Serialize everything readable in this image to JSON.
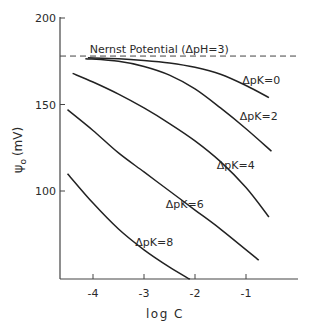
{
  "chart_data": {
    "type": "line",
    "title": "",
    "xlabel": "log C",
    "ylabel": "ψo (mV)",
    "xlim": [
      -4.65,
      0.5
    ],
    "ylim": [
      49,
      205
    ],
    "x_ticks": [
      -4,
      -3,
      -2,
      -1
    ],
    "x_tick_labels": [
      "-4",
      "-3",
      "-2",
      "-1"
    ],
    "y_ticks": [
      100,
      150,
      200
    ],
    "y_tick_labels": [
      "100",
      "150",
      "200"
    ],
    "grid": false,
    "legend": "inline labels on curves",
    "reference_line": {
      "label": "Nernst Potential (ΔpH=3)",
      "y": 178,
      "style": "dashed"
    },
    "series": [
      {
        "name": "ΔpK=0",
        "x": [
          -4.1,
          -3.5,
          -3.0,
          -2.5,
          -2.0,
          -1.5,
          -1.0,
          -0.55
        ],
        "y": [
          177,
          176.5,
          175.5,
          174,
          171.5,
          167.5,
          161,
          154
        ]
      },
      {
        "name": "ΔpK=2",
        "x": [
          -4.15,
          -3.5,
          -3.0,
          -2.5,
          -2.0,
          -1.5,
          -1.0,
          -0.5
        ],
        "y": [
          176.5,
          175,
          172,
          167,
          159,
          148,
          136,
          123
        ]
      },
      {
        "name": "ΔpK=4",
        "x": [
          -4.4,
          -4.0,
          -3.5,
          -3.0,
          -2.5,
          -2.0,
          -1.5,
          -1.0,
          -0.55
        ],
        "y": [
          168,
          163,
          156,
          148,
          139,
          129,
          117,
          102,
          85
        ]
      },
      {
        "name": "ΔpK=6",
        "x": [
          -4.5,
          -4.0,
          -3.5,
          -3.0,
          -2.5,
          -2.0,
          -1.5,
          -0.75
        ],
        "y": [
          147,
          135,
          122,
          111,
          100,
          89,
          78,
          60
        ]
      },
      {
        "name": "ΔpK=8",
        "x": [
          -4.5,
          -4.0,
          -3.5,
          -3.0,
          -2.5,
          -2.1
        ],
        "y": [
          110,
          93,
          78,
          66,
          56,
          49
        ]
      }
    ],
    "annotations": [
      {
        "text": "Nernst Potential (ΔpH=3)",
        "x": -2.7,
        "y": 180
      },
      {
        "text": "ΔpK=0",
        "x": -0.7,
        "y": 162
      },
      {
        "text": "ΔpK=2",
        "x": -0.75,
        "y": 141
      },
      {
        "text": "ΔpK=4",
        "x": -1.2,
        "y": 113
      },
      {
        "text": "ΔpK=6",
        "x": -2.2,
        "y": 90
      },
      {
        "text": "ΔpK=8",
        "x": -2.8,
        "y": 68
      }
    ]
  },
  "labels": {
    "xlabel": "log C",
    "ylabel_main": "ψ",
    "ylabel_sub": "o",
    "ylabel_unit": "(mV)",
    "nernst": "Nernst Potential (ΔpH=3)"
  }
}
